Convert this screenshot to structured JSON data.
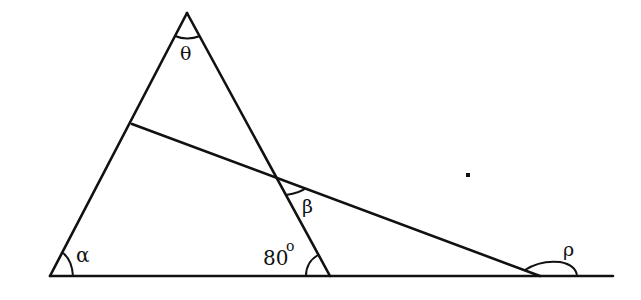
{
  "diagram": {
    "type": "geometry-triangle-with-transversal",
    "colors": {
      "stroke": "#111111",
      "background": "#ffffff"
    },
    "points": {
      "apex": [
        187,
        13
      ],
      "bottom_left": [
        50,
        276
      ],
      "bottom_right": [
        330,
        276
      ],
      "baseline_end": [
        613,
        276
      ],
      "transversal_start": [
        132,
        124
      ],
      "transversal_end": [
        540,
        276
      ],
      "intersection": [
        277,
        178
      ],
      "dot": [
        468,
        175
      ]
    },
    "labels": {
      "theta": "θ",
      "alpha": "α",
      "beta": "β",
      "angle_80": "80",
      "degree": "o",
      "rho": "ρ"
    }
  }
}
